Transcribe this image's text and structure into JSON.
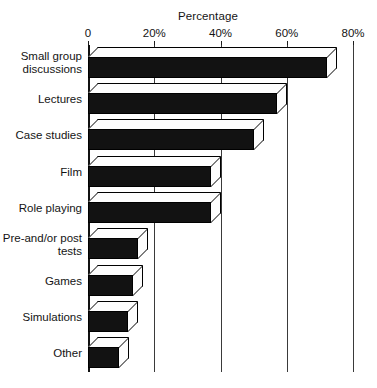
{
  "chart_data": {
    "type": "bar",
    "orientation": "horizontal",
    "style": "3d-bar",
    "title": "",
    "xlabel": "Percentage",
    "ylabel": "",
    "xlim": [
      0,
      80
    ],
    "grid": true,
    "legend": null,
    "xtick_labels": [
      "0",
      "20%",
      "40%",
      "60%",
      "80%"
    ],
    "xtick_values": [
      0,
      20,
      40,
      60,
      80
    ],
    "categories": [
      "Small group discussions",
      "Lectures",
      "Case studies",
      "Film",
      "Role playing",
      "Pre-and/or post tests",
      "Games",
      "Simulations",
      "Other"
    ],
    "values": [
      72,
      57,
      50,
      37,
      37,
      15,
      13.5,
      12,
      9.5
    ],
    "bar_color": "#121212",
    "bar_face_color": "#fdfdfd",
    "axis_color": "#111111",
    "grid_color": "#3a3a3a",
    "background": "#ffffff"
  },
  "labels": {
    "axis_title": "Percentage",
    "category_lines": [
      [
        "Small group",
        "discussions"
      ],
      [
        "Lectures"
      ],
      [
        "Case studies"
      ],
      [
        "Film"
      ],
      [
        "Role playing"
      ],
      [
        "Pre-and/or post",
        "tests"
      ],
      [
        "Games"
      ],
      [
        "Simulations"
      ],
      [
        "Other"
      ]
    ]
  }
}
